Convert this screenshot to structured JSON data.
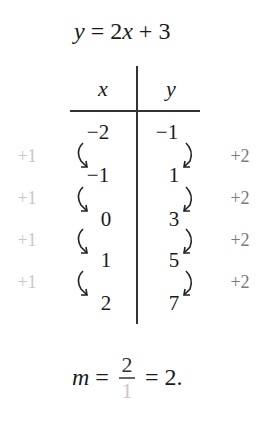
{
  "equation": {
    "lhs": "y",
    "eq": " = ",
    "coef": "2",
    "var": "x",
    "plus": " + ",
    "const": "3"
  },
  "table": {
    "headers": {
      "x": "x",
      "y": "y"
    },
    "rows": [
      {
        "x": "−2",
        "y": "−1"
      },
      {
        "x": "−1",
        "y": "1"
      },
      {
        "x": "0",
        "y": "3"
      },
      {
        "x": "1",
        "y": "5"
      },
      {
        "x": "2",
        "y": "7"
      }
    ],
    "x_deltas": [
      "+1",
      "+1",
      "+1",
      "+1"
    ],
    "y_deltas": [
      "+2",
      "+2",
      "+2",
      "+2"
    ]
  },
  "slope": {
    "var": "m",
    "eq1": " = ",
    "numerator": "2",
    "denominator": "1",
    "eq2": " = ",
    "result": "2."
  },
  "colors": {
    "text": "#1a1a1a",
    "x_delta": "#c8c8c8",
    "y_delta": "#7a7a7a"
  }
}
